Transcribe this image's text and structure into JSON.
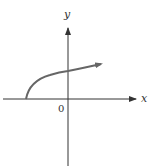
{
  "diagram": {
    "type": "function-graph",
    "axes": {
      "x_label": "x",
      "y_label": "y",
      "origin_label": "0"
    },
    "curve": {
      "shape": "y = sqrt(x + a), a > 0",
      "start": "point on negative x-axis",
      "direction": "increasing, arrow to the right"
    },
    "colors": {
      "axis": "#333333",
      "curve": "#666666",
      "background": "#ffffff"
    }
  }
}
